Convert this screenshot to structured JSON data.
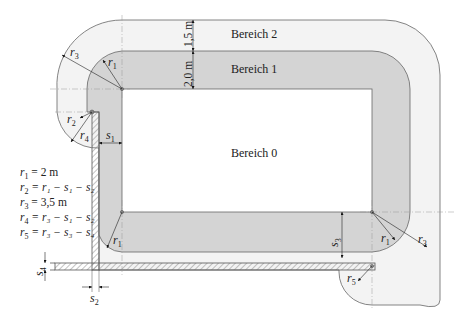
{
  "diagram": {
    "zones": [
      {
        "id": "bereich-0",
        "label": "Bereich 0",
        "fill": "#ffffff"
      },
      {
        "id": "bereich-1",
        "label": "Bereich 1",
        "fill": "#d4d4d4"
      },
      {
        "id": "bereich-2",
        "label": "Bereich 2",
        "fill": "#f3f3f3"
      }
    ],
    "dimensions": {
      "zone2_width": "1,5 m",
      "zone1_width": "2,0 m"
    },
    "symbols": {
      "s1": "s",
      "s1_sub": "1",
      "s2": "s",
      "s2_sub": "2",
      "s3": "s",
      "s3_sub": "3",
      "s4": "s",
      "s4_sub": "4",
      "r1": "r",
      "r1_sub": "1",
      "r2": "r",
      "r2_sub": "2",
      "r3": "r",
      "r3_sub": "3",
      "r4": "r",
      "r4_sub": "4",
      "r5": "r",
      "r5_sub": "5"
    },
    "formulas": [
      {
        "lhs": "r",
        "lhs_sub": "1",
        "rhs": "= 2 m"
      },
      {
        "lhs": "r",
        "lhs_sub": "2",
        "rhs": "= r₁ − s₁ − s₂"
      },
      {
        "lhs": "r",
        "lhs_sub": "3",
        "rhs": "= 3,5 m"
      },
      {
        "lhs": "r",
        "lhs_sub": "4",
        "rhs": "= r₃ − s₁ − s₂"
      },
      {
        "lhs": "r",
        "lhs_sub": "5",
        "rhs": "= r₃ − s₃ − s₄"
      }
    ],
    "colors": {
      "zone1": "#d4d4d4",
      "zone2": "#f3f3f3",
      "outline": "#555555",
      "hatch": "#777777"
    }
  }
}
